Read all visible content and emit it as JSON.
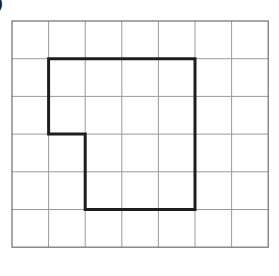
{
  "label": {
    "text": ")"
  },
  "grid": {
    "cols": 7,
    "rows": 6,
    "x0": 12,
    "y0": 21,
    "cell_w": 36.6,
    "cell_h": 37.7,
    "line_color": "#9a9a9a",
    "border_color": "#6e6e6e"
  },
  "shape": {
    "description": "Thick-outlined rectilinear polygon drawn on grid",
    "stroke_color": "#1e1e1e",
    "stroke_width": 3,
    "vertices_grid": [
      [
        1,
        1
      ],
      [
        5,
        1
      ],
      [
        5,
        5
      ],
      [
        2,
        5
      ],
      [
        2,
        3
      ],
      [
        1,
        3
      ]
    ]
  }
}
